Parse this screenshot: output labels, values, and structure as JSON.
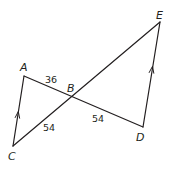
{
  "diagram": {
    "type": "geometry",
    "points": {
      "A": {
        "label": "A",
        "x": 24,
        "y": 76
      },
      "B": {
        "label": "B",
        "x": 71,
        "y": 97
      },
      "C": {
        "label": "C",
        "x": 13,
        "y": 146
      },
      "D": {
        "label": "D",
        "x": 143,
        "y": 127
      },
      "E": {
        "label": "E",
        "x": 160,
        "y": 22
      }
    },
    "segments": [
      {
        "from": "A",
        "to": "C",
        "parallel_mark": true
      },
      {
        "from": "A",
        "to": "D"
      },
      {
        "from": "C",
        "to": "E"
      },
      {
        "from": "D",
        "to": "E",
        "parallel_mark": true
      }
    ],
    "lengths": {
      "AB": "36",
      "CB": "54",
      "BD": "54"
    },
    "colors": {
      "stroke": "#231f20",
      "background": "#ffffff"
    }
  }
}
